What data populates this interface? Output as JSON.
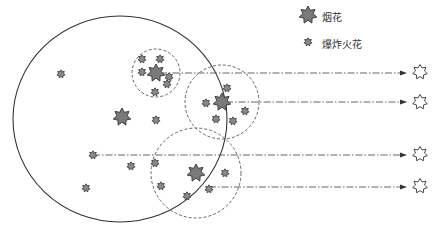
{
  "legend": {
    "items": [
      {
        "label": "烟花",
        "icon": "large-star-icon"
      },
      {
        "label": "爆炸火花",
        "icon": "small-star-icon"
      }
    ]
  },
  "diagram": {
    "outer_circle": {
      "cx": 120,
      "cy": 119,
      "rx": 107,
      "ry": 103
    },
    "fireworks": [
      {
        "x": 156,
        "y": 73,
        "radius": 24
      },
      {
        "x": 222,
        "y": 102,
        "radius": 37
      },
      {
        "x": 196,
        "y": 173,
        "radius": 45
      },
      {
        "x": 122,
        "y": 117
      }
    ],
    "sparks": [
      {
        "x": 61,
        "y": 74
      },
      {
        "x": 142,
        "y": 59
      },
      {
        "x": 160,
        "y": 59
      },
      {
        "x": 142,
        "y": 72
      },
      {
        "x": 169,
        "y": 77
      },
      {
        "x": 167,
        "y": 84
      },
      {
        "x": 155,
        "y": 92
      },
      {
        "x": 156,
        "y": 120
      },
      {
        "x": 227,
        "y": 88
      },
      {
        "x": 206,
        "y": 103
      },
      {
        "x": 245,
        "y": 111
      },
      {
        "x": 216,
        "y": 119
      },
      {
        "x": 233,
        "y": 121
      },
      {
        "x": 93,
        "y": 155
      },
      {
        "x": 155,
        "y": 163
      },
      {
        "x": 131,
        "y": 166
      },
      {
        "x": 161,
        "y": 186
      },
      {
        "x": 225,
        "y": 173
      },
      {
        "x": 209,
        "y": 189
      },
      {
        "x": 187,
        "y": 196
      },
      {
        "x": 86,
        "y": 188
      }
    ],
    "arrows": [
      {
        "x1": 160,
        "y1": 73,
        "x2": 406,
        "y2": 73
      },
      {
        "x1": 226,
        "y1": 102,
        "x2": 406,
        "y2": 102
      },
      {
        "x1": 93,
        "y1": 155,
        "x2": 406,
        "y2": 155
      },
      {
        "x1": 209,
        "y1": 187,
        "x2": 406,
        "y2": 187
      }
    ],
    "targets": [
      {
        "x": 420,
        "y": 72
      },
      {
        "x": 420,
        "y": 102
      },
      {
        "x": 420,
        "y": 154
      },
      {
        "x": 420,
        "y": 186
      }
    ]
  }
}
